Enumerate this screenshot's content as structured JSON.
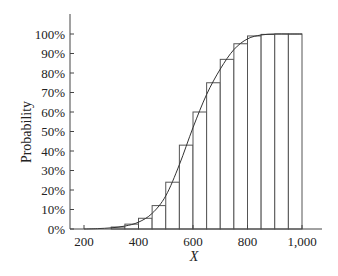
{
  "chart_data": {
    "type": "bar",
    "subtype": "cumulative histogram with smooth CDF curve",
    "title": "",
    "xlabel": "X",
    "ylabel": "Probability",
    "xlim": [
      150,
      1080
    ],
    "ylim": [
      0,
      100
    ],
    "x_ticks": [
      200,
      400,
      600,
      800,
      1000
    ],
    "x_tick_labels": [
      "200",
      "400",
      "600",
      "800",
      "1,000"
    ],
    "y_ticks": [
      0,
      10,
      20,
      30,
      40,
      50,
      60,
      70,
      80,
      90,
      100
    ],
    "y_tick_labels": [
      "0%",
      "10%",
      "20%",
      "30%",
      "40%",
      "50%",
      "60%",
      "70%",
      "80%",
      "90%",
      "100%"
    ],
    "bin_width": 50,
    "bins": [
      {
        "start": 300,
        "end": 350,
        "value": 1
      },
      {
        "start": 350,
        "end": 400,
        "value": 2.5
      },
      {
        "start": 400,
        "end": 450,
        "value": 5.5
      },
      {
        "start": 450,
        "end": 500,
        "value": 12
      },
      {
        "start": 500,
        "end": 550,
        "value": 24
      },
      {
        "start": 550,
        "end": 600,
        "value": 43
      },
      {
        "start": 600,
        "end": 650,
        "value": 60
      },
      {
        "start": 650,
        "end": 700,
        "value": 75
      },
      {
        "start": 700,
        "end": 750,
        "value": 87
      },
      {
        "start": 750,
        "end": 800,
        "value": 95
      },
      {
        "start": 800,
        "end": 850,
        "value": 99
      },
      {
        "start": 850,
        "end": 900,
        "value": 99.8
      },
      {
        "start": 900,
        "end": 950,
        "value": 100
      },
      {
        "start": 950,
        "end": 1000,
        "value": 100
      }
    ],
    "curve": {
      "x": [
        200,
        250,
        300,
        350,
        400,
        450,
        500,
        550,
        600,
        650,
        700,
        750,
        800,
        850,
        900,
        950,
        1000
      ],
      "y": [
        0,
        0.2,
        0.6,
        1.5,
        3.5,
        8,
        17,
        33,
        52,
        69,
        82,
        92,
        97.5,
        99.5,
        100,
        100,
        100
      ]
    },
    "grid": false,
    "legend": null
  }
}
